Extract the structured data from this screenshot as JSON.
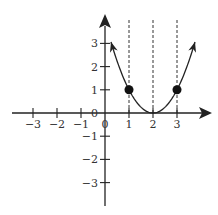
{
  "chart_data": {
    "type": "line",
    "title": "",
    "function": "y = (x - 2)^2",
    "xlabel": "",
    "ylabel": "",
    "xlim": [
      -4,
      4.3
    ],
    "ylim": [
      -3.8,
      4
    ],
    "grid": false,
    "x_ticks": [
      -3,
      -2,
      -1,
      0,
      1,
      2,
      3
    ],
    "x_tick_labels": [
      "−3",
      "−2",
      "−1",
      "0",
      "1",
      "2",
      "3"
    ],
    "y_ticks": [
      3,
      2,
      1,
      0,
      -1,
      -2,
      -3
    ],
    "y_tick_labels": [
      "3",
      "2",
      "1",
      "0",
      "−1",
      "−2",
      "−3"
    ],
    "curve_domain": [
      0.25,
      3.75
    ],
    "points": [
      {
        "x": 1,
        "y": 1
      },
      {
        "x": 3,
        "y": 1
      }
    ],
    "dashed_vertical_lines": [
      1,
      2,
      3
    ]
  },
  "colors": {
    "axis": "#222222",
    "curve": "#222222",
    "dashed": "#333333",
    "point": "#111111",
    "label": "#333333"
  }
}
